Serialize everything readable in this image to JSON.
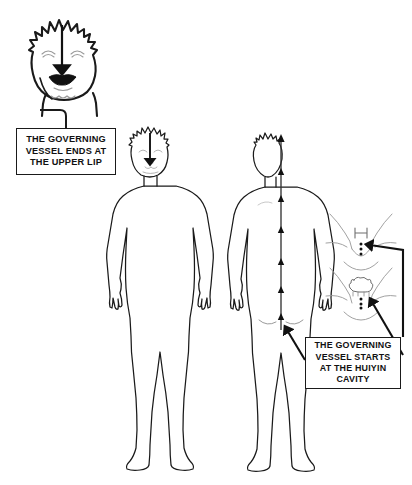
{
  "diagram": {
    "background_color": "#ffffff",
    "line_color": "#1a1a1a",
    "arrow_color": "#111111"
  },
  "callouts": [
    {
      "id": "upper-lip",
      "lines": [
        "THE GOVERNING",
        "VESSEL ENDS AT",
        "THE UPPER LIP"
      ],
      "text": "THE GOVERNING VESSEL ENDS AT THE UPPER LIP"
    },
    {
      "id": "huiyin",
      "lines": [
        "THE GOVERNING",
        "VESSEL STARTS",
        "AT THE HUIYIN",
        "CAVITY"
      ],
      "text": "THE GOVERNING VESSEL STARTS AT THE HUIYIN CAVITY"
    }
  ],
  "figures": [
    {
      "id": "head-closeup",
      "label": "enlarged head front view with downward arrow to upper lip"
    },
    {
      "id": "body-front",
      "label": "full body front view with downward arrow on face"
    },
    {
      "id": "body-back",
      "label": "full body back view with upward arrow along spine"
    },
    {
      "id": "perineum-detail-male",
      "label": "male perineum detail with arrow to huiyin point"
    },
    {
      "id": "perineum-detail-female",
      "label": "female perineum detail with arrow to huiyin point"
    }
  ],
  "icons": {
    "arrow_down": "arrow-down-icon",
    "arrow_up": "arrow-up-icon",
    "pointer_arrow": "pointer-arrow-icon"
  }
}
